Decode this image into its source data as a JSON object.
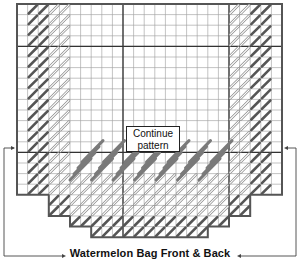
{
  "diagram": {
    "title": "Watermelon Bag Front & Back",
    "note_line1": "Continue",
    "note_line2": "pattern",
    "grid": {
      "origin_x": 17,
      "origin_y": 4,
      "cell": 10.6,
      "cols": 25,
      "rows": 23,
      "thick_vertical_cols": [
        10,
        20
      ],
      "thick_horizontal_rows": [
        4,
        14
      ]
    },
    "colors": {
      "grid_line": "#9a9a9a",
      "thick_line": "#333333",
      "outline": "#555555",
      "dark_stitch": "#555555",
      "light_stitch_fill": "#ffffff",
      "light_stitch_stroke": "#888888",
      "long_stitch": "#7a7a7a",
      "arrow": "#444444"
    },
    "legend_items": [
      {
        "name": "dark-stitch",
        "description": "dark diagonal stitch (rind)"
      },
      {
        "name": "light-stitch",
        "description": "light outlined diagonal stitch"
      },
      {
        "name": "long-stitch",
        "description": "long slanted stitch (flesh)"
      }
    ]
  }
}
